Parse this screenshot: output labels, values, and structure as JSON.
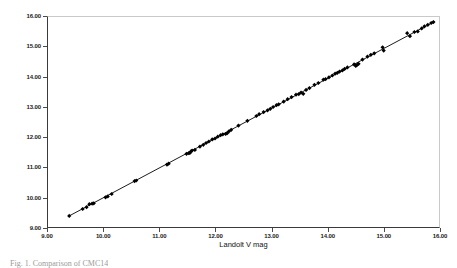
{
  "chart_data": {
    "type": "scatter",
    "title": "",
    "xlabel": "Landolt V mag",
    "ylabel": "CMC14 calculated V mag",
    "xlim": [
      9.0,
      16.0
    ],
    "ylim": [
      9.0,
      16.0
    ],
    "grid": false,
    "legend": null,
    "x_ticks": [
      "9.00",
      "10.00",
      "11.00",
      "12.00",
      "13.00",
      "14.00",
      "15.00",
      "16.00"
    ],
    "y_ticks": [
      "9.00",
      "10.00",
      "11.00",
      "12.00",
      "13.00",
      "14.00",
      "15.00",
      "16.00"
    ],
    "x_tick_values": [
      9,
      10,
      11,
      12,
      13,
      14,
      15,
      16
    ],
    "y_tick_values": [
      9,
      10,
      11,
      12,
      13,
      14,
      15,
      16
    ],
    "marker": "filled-diamond",
    "marker_color": "#000000",
    "marker_size": 2.1,
    "fit_line": {
      "label": "identity / best fit line",
      "color": "#000000",
      "width": 0.9,
      "x_start": 9.37,
      "y_start": 9.36,
      "x_end": 15.92,
      "y_end": 15.85
    },
    "series": [
      {
        "name": "CMC14 vs Landolt V",
        "points": [
          [
            9.38,
            9.37
          ],
          [
            9.62,
            9.6
          ],
          [
            9.69,
            9.66
          ],
          [
            9.74,
            9.76
          ],
          [
            9.79,
            9.78
          ],
          [
            9.82,
            9.79
          ],
          [
            10.03,
            9.99
          ],
          [
            10.07,
            10.02
          ],
          [
            10.14,
            10.1
          ],
          [
            10.55,
            10.53
          ],
          [
            10.58,
            10.55
          ],
          [
            11.13,
            11.08
          ],
          [
            11.16,
            11.11
          ],
          [
            11.48,
            11.44
          ],
          [
            11.52,
            11.46
          ],
          [
            11.54,
            11.47
          ],
          [
            11.56,
            11.52
          ],
          [
            11.58,
            11.55
          ],
          [
            11.63,
            11.57
          ],
          [
            11.72,
            11.68
          ],
          [
            11.78,
            11.74
          ],
          [
            11.83,
            11.8
          ],
          [
            11.88,
            11.85
          ],
          [
            11.94,
            11.92
          ],
          [
            11.99,
            11.95
          ],
          [
            12.04,
            12.01
          ],
          [
            12.09,
            12.06
          ],
          [
            12.13,
            12.09
          ],
          [
            12.18,
            12.1
          ],
          [
            12.21,
            12.13
          ],
          [
            12.24,
            12.19
          ],
          [
            12.28,
            12.24
          ],
          [
            12.41,
            12.38
          ],
          [
            12.57,
            12.54
          ],
          [
            12.73,
            12.7
          ],
          [
            12.78,
            12.76
          ],
          [
            12.86,
            12.83
          ],
          [
            12.93,
            12.89
          ],
          [
            12.98,
            12.94
          ],
          [
            13.03,
            13.0
          ],
          [
            13.09,
            13.06
          ],
          [
            13.13,
            13.09
          ],
          [
            13.22,
            13.18
          ],
          [
            13.29,
            13.26
          ],
          [
            13.36,
            13.33
          ],
          [
            13.44,
            13.41
          ],
          [
            13.49,
            13.43
          ],
          [
            13.53,
            13.48
          ],
          [
            13.57,
            13.44
          ],
          [
            13.62,
            13.57
          ],
          [
            13.68,
            13.63
          ],
          [
            13.77,
            13.74
          ],
          [
            13.84,
            13.8
          ],
          [
            13.93,
            13.91
          ],
          [
            13.97,
            13.93
          ],
          [
            14.03,
            13.99
          ],
          [
            14.09,
            14.05
          ],
          [
            14.14,
            14.11
          ],
          [
            14.18,
            14.14
          ],
          [
            14.22,
            14.18
          ],
          [
            14.27,
            14.22
          ],
          [
            14.31,
            14.27
          ],
          [
            14.36,
            14.32
          ],
          [
            14.48,
            14.42
          ],
          [
            14.51,
            14.37
          ],
          [
            14.53,
            14.4
          ],
          [
            14.56,
            14.44
          ],
          [
            14.63,
            14.58
          ],
          [
            14.72,
            14.68
          ],
          [
            14.78,
            14.74
          ],
          [
            14.84,
            14.79
          ],
          [
            14.99,
            14.99
          ],
          [
            15.01,
            14.88
          ],
          [
            15.43,
            15.46
          ],
          [
            15.48,
            15.36
          ],
          [
            15.56,
            15.5
          ],
          [
            15.62,
            15.52
          ],
          [
            15.69,
            15.62
          ],
          [
            15.74,
            15.69
          ],
          [
            15.8,
            15.74
          ],
          [
            15.86,
            15.8
          ],
          [
            15.9,
            15.83
          ]
        ]
      }
    ]
  },
  "axes": {
    "y_title": "CMC14 calculated V mag",
    "x_title": "Landolt V mag"
  },
  "caption": {
    "text": "Fig. 1. Comparison of CMC14"
  }
}
